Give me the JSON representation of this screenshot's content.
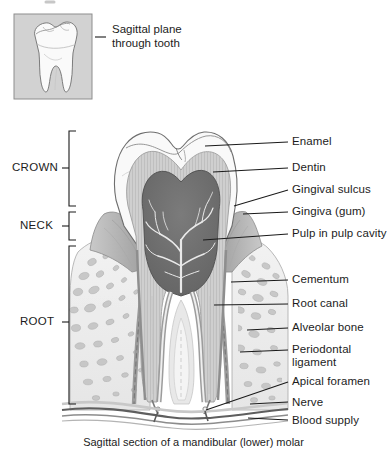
{
  "figure": {
    "caption": "Sagittal section of a mandibular (lower) molar",
    "inset": {
      "caption_line1": "Sagittal plane",
      "caption_line2": "through tooth",
      "subject": "whole-molar-outline"
    },
    "region_labels": [
      {
        "id": "crown",
        "text": "CROWN"
      },
      {
        "id": "neck",
        "text": "NECK"
      },
      {
        "id": "root",
        "text": "ROOT"
      }
    ],
    "part_labels": [
      {
        "id": "enamel",
        "text": "Enamel"
      },
      {
        "id": "dentin",
        "text": "Dentin"
      },
      {
        "id": "gingival-sulcus",
        "text": "Gingival sulcus"
      },
      {
        "id": "gingiva",
        "text": "Gingiva (gum)"
      },
      {
        "id": "pulp-in-pulp-cavity",
        "text": "Pulp in pulp cavity"
      },
      {
        "id": "cementum",
        "text": "Cementum"
      },
      {
        "id": "root-canal",
        "text": "Root canal"
      },
      {
        "id": "alveolar-bone",
        "text": "Alveolar bone"
      },
      {
        "id": "periodontal-ligament-line1",
        "text": "Periodontal"
      },
      {
        "id": "periodontal-ligament-line2",
        "text": "ligament"
      },
      {
        "id": "apical-foramen",
        "text": "Apical foramen"
      },
      {
        "id": "nerve",
        "text": "Nerve"
      },
      {
        "id": "blood-supply",
        "text": "Blood supply"
      }
    ],
    "colors": {
      "background": "#ffffff",
      "ink": "#1c1c1c",
      "leader_line": "#1a1a1a",
      "inset_panel": "#d2d2d2",
      "inset_border": "#8e8e8e",
      "enamel": "#f7f7f7",
      "dentin": "#cfcfcf",
      "pulp": "#6f6f6f",
      "pulp_vessel": "#ececec",
      "gingiva": "#b4b4b4",
      "bone": "#efefef",
      "bone_cavity": "#bdbdbd",
      "ligament": "#a8a8a8",
      "cementum": "#9a9a9a",
      "nerve": "#5c5c5c",
      "outline": "#7d7d7d"
    }
  }
}
